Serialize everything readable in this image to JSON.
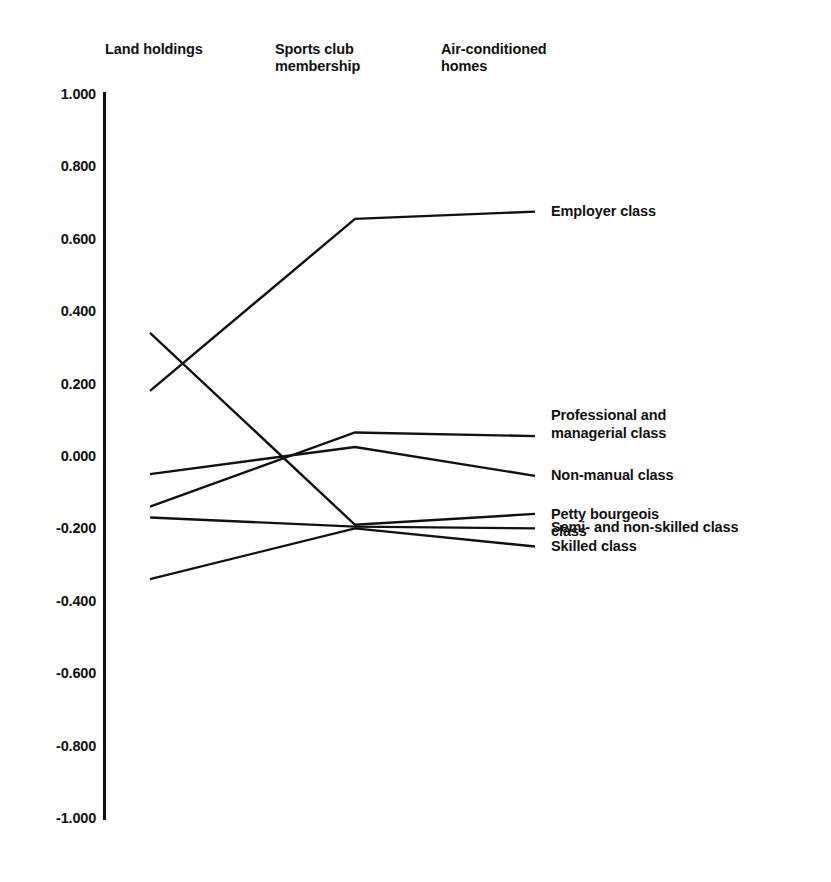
{
  "chart_data": {
    "type": "line",
    "title": "",
    "subtitle": "",
    "xlabel": "",
    "ylabel": "",
    "categories": [
      "Land holdings",
      "Sports club\nmembership",
      "Air-conditioned\nhomes"
    ],
    "ylim": [
      -1.0,
      1.0
    ],
    "ytick_labels": [
      "1.000",
      "0.800",
      "0.600",
      "0.400",
      "0.200",
      "0.000",
      "-0.200",
      "-0.400",
      "-0.600",
      "-0.800",
      "-1.000"
    ],
    "ytick_values": [
      1.0,
      0.8,
      0.6,
      0.4,
      0.2,
      0.0,
      -0.2,
      -0.4,
      -0.6,
      -0.8,
      -1.0
    ],
    "grid": false,
    "legend_position": "right-inline",
    "series": [
      {
        "name": "Employer class",
        "label": "Employer class",
        "values": [
          0.18,
          0.655,
          0.675
        ]
      },
      {
        "name": "Professional and managerial class",
        "label": "Professional and\nmanagerial class",
        "values": [
          -0.14,
          0.065,
          0.055
        ]
      },
      {
        "name": "Non-manual class",
        "label": "Non-manual class",
        "values": [
          -0.05,
          0.025,
          -0.055
        ]
      },
      {
        "name": "Petty bourgeois class",
        "label": "Petty bourgeois\nclass",
        "values": [
          0.34,
          -0.19,
          -0.16
        ]
      },
      {
        "name": "Semi- and non-skilled class",
        "label": "Semi- and non-skilled class",
        "values": [
          -0.17,
          -0.195,
          -0.2
        ]
      },
      {
        "name": "Skilled class",
        "label": "Skilled class",
        "values": [
          -0.34,
          -0.2,
          -0.25
        ]
      }
    ],
    "line_color": "#111111"
  }
}
